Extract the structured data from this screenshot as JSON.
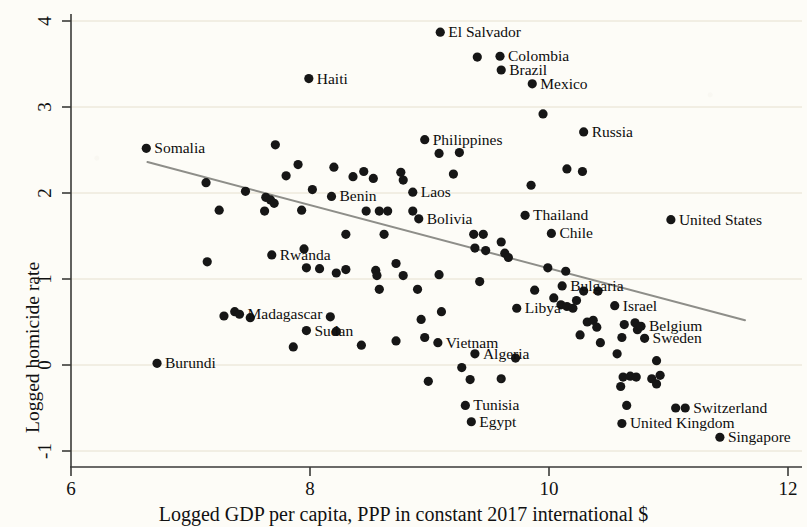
{
  "chart_data": {
    "type": "scatter",
    "title": "",
    "xlabel": "Logged GDP per capita, PPP in constant 2017 international $",
    "ylabel": "Logged homicide rate",
    "xlim": [
      6,
      12
    ],
    "ylim": [
      -1,
      4
    ],
    "xticks": [
      6,
      8,
      10,
      12
    ],
    "yticks": [
      -1,
      0,
      1,
      2,
      3,
      4
    ],
    "grid": true,
    "grid_axis": "y",
    "legend": "none",
    "marker": "filled-circle",
    "marker_color": "#161616",
    "fit_line": {
      "label": "linear fit",
      "color": "#8a8a86",
      "x_start": 6.64,
      "y_start": 2.36,
      "x_end": 11.64,
      "y_end": 0.52
    },
    "labeled_points": [
      {
        "name": "El Salvador",
        "x": 9.09,
        "y": 3.87,
        "label_side": "right"
      },
      {
        "name": "Colombia",
        "x": 9.59,
        "y": 3.59,
        "label_side": "right"
      },
      {
        "name": "Brazil",
        "x": 9.6,
        "y": 3.43,
        "label_side": "right"
      },
      {
        "name": "Mexico",
        "x": 9.86,
        "y": 3.27,
        "label_side": "right"
      },
      {
        "name": "Haiti",
        "x": 7.99,
        "y": 3.33,
        "label_side": "right"
      },
      {
        "name": "Somalia",
        "x": 6.63,
        "y": 2.52,
        "label_side": "right"
      },
      {
        "name": "Philippines",
        "x": 8.96,
        "y": 2.62,
        "label_side": "right"
      },
      {
        "name": "Russia",
        "x": 10.29,
        "y": 2.71,
        "label_side": "right"
      },
      {
        "name": "Laos",
        "x": 8.86,
        "y": 2.01,
        "label_side": "right"
      },
      {
        "name": "Benin",
        "x": 8.18,
        "y": 1.96,
        "label_side": "right"
      },
      {
        "name": "Thailand",
        "x": 9.8,
        "y": 1.74,
        "label_side": "right"
      },
      {
        "name": "Bolivia",
        "x": 8.91,
        "y": 1.7,
        "label_side": "right"
      },
      {
        "name": "United States",
        "x": 11.02,
        "y": 1.69,
        "label_side": "right"
      },
      {
        "name": "Chile",
        "x": 10.02,
        "y": 1.53,
        "label_side": "right"
      },
      {
        "name": "Rwanda",
        "x": 7.68,
        "y": 1.28,
        "label_side": "right"
      },
      {
        "name": "Bulgaria",
        "x": 10.11,
        "y": 0.92,
        "label_side": "right"
      },
      {
        "name": "Israel",
        "x": 10.55,
        "y": 0.69,
        "label_side": "right"
      },
      {
        "name": "Libya",
        "x": 9.73,
        "y": 0.66,
        "label_side": "right"
      },
      {
        "name": "Madagascar",
        "x": 7.41,
        "y": 0.59,
        "label_side": "right"
      },
      {
        "name": "Belgium",
        "x": 10.77,
        "y": 0.45,
        "label_side": "right"
      },
      {
        "name": "Sweden",
        "x": 10.8,
        "y": 0.31,
        "label_side": "right"
      },
      {
        "name": "Sudan",
        "x": 7.97,
        "y": 0.4,
        "label_side": "right"
      },
      {
        "name": "Vietnam",
        "x": 9.07,
        "y": 0.26,
        "label_side": "right"
      },
      {
        "name": "Algeria",
        "x": 9.38,
        "y": 0.13,
        "label_side": "right"
      },
      {
        "name": "Burundi",
        "x": 6.72,
        "y": 0.02,
        "label_side": "right"
      },
      {
        "name": "Tunisia",
        "x": 9.3,
        "y": -0.47,
        "label_side": "right"
      },
      {
        "name": "Switzerland",
        "x": 11.14,
        "y": -0.5,
        "label_side": "right"
      },
      {
        "name": "Egypt",
        "x": 9.35,
        "y": -0.66,
        "label_side": "right"
      },
      {
        "name": "United Kingdom",
        "x": 10.61,
        "y": -0.68,
        "label_side": "right"
      },
      {
        "name": "Singapore",
        "x": 11.43,
        "y": -0.84,
        "label_side": "right"
      }
    ],
    "unlabeled_points": [
      {
        "x": 9.4,
        "y": 3.58
      },
      {
        "x": 9.95,
        "y": 2.92
      },
      {
        "x": 9.08,
        "y": 2.46
      },
      {
        "x": 9.25,
        "y": 2.47
      },
      {
        "x": 10.15,
        "y": 2.28
      },
      {
        "x": 10.28,
        "y": 2.25
      },
      {
        "x": 9.2,
        "y": 2.22
      },
      {
        "x": 9.85,
        "y": 2.09
      },
      {
        "x": 7.71,
        "y": 2.56
      },
      {
        "x": 7.9,
        "y": 2.33
      },
      {
        "x": 7.8,
        "y": 2.2
      },
      {
        "x": 8.2,
        "y": 2.3
      },
      {
        "x": 8.45,
        "y": 2.25
      },
      {
        "x": 8.53,
        "y": 2.17
      },
      {
        "x": 8.76,
        "y": 2.24
      },
      {
        "x": 8.78,
        "y": 2.15
      },
      {
        "x": 8.36,
        "y": 2.19
      },
      {
        "x": 7.13,
        "y": 2.12
      },
      {
        "x": 7.46,
        "y": 2.02
      },
      {
        "x": 7.24,
        "y": 1.8
      },
      {
        "x": 7.63,
        "y": 1.95
      },
      {
        "x": 7.67,
        "y": 1.92
      },
      {
        "x": 7.7,
        "y": 1.88
      },
      {
        "x": 7.62,
        "y": 1.79
      },
      {
        "x": 7.93,
        "y": 1.8
      },
      {
        "x": 8.02,
        "y": 2.04
      },
      {
        "x": 8.47,
        "y": 1.79
      },
      {
        "x": 8.58,
        "y": 1.79
      },
      {
        "x": 8.65,
        "y": 1.79
      },
      {
        "x": 8.86,
        "y": 1.79
      },
      {
        "x": 8.3,
        "y": 1.52
      },
      {
        "x": 8.62,
        "y": 1.52
      },
      {
        "x": 9.37,
        "y": 1.52
      },
      {
        "x": 9.45,
        "y": 1.52
      },
      {
        "x": 9.38,
        "y": 1.36
      },
      {
        "x": 9.47,
        "y": 1.33
      },
      {
        "x": 9.6,
        "y": 1.43
      },
      {
        "x": 9.63,
        "y": 1.3
      },
      {
        "x": 9.66,
        "y": 1.25
      },
      {
        "x": 7.14,
        "y": 1.2
      },
      {
        "x": 7.95,
        "y": 1.35
      },
      {
        "x": 7.97,
        "y": 1.13
      },
      {
        "x": 8.08,
        "y": 1.12
      },
      {
        "x": 8.22,
        "y": 1.07
      },
      {
        "x": 8.3,
        "y": 1.11
      },
      {
        "x": 8.55,
        "y": 1.1
      },
      {
        "x": 8.56,
        "y": 1.04
      },
      {
        "x": 8.72,
        "y": 1.18
      },
      {
        "x": 8.78,
        "y": 1.04
      },
      {
        "x": 9.08,
        "y": 1.05
      },
      {
        "x": 9.42,
        "y": 0.97
      },
      {
        "x": 9.99,
        "y": 1.13
      },
      {
        "x": 10.14,
        "y": 1.09
      },
      {
        "x": 9.88,
        "y": 0.87
      },
      {
        "x": 10.29,
        "y": 0.86
      },
      {
        "x": 10.41,
        "y": 0.86
      },
      {
        "x": 10.04,
        "y": 0.78
      },
      {
        "x": 10.1,
        "y": 0.7
      },
      {
        "x": 10.15,
        "y": 0.68
      },
      {
        "x": 10.2,
        "y": 0.66
      },
      {
        "x": 10.23,
        "y": 0.75
      },
      {
        "x": 7.37,
        "y": 0.62
      },
      {
        "x": 7.28,
        "y": 0.57
      },
      {
        "x": 7.5,
        "y": 0.55
      },
      {
        "x": 8.17,
        "y": 0.56
      },
      {
        "x": 8.22,
        "y": 0.39
      },
      {
        "x": 7.86,
        "y": 0.21
      },
      {
        "x": 8.43,
        "y": 0.23
      },
      {
        "x": 8.58,
        "y": 0.88
      },
      {
        "x": 8.9,
        "y": 0.88
      },
      {
        "x": 8.93,
        "y": 0.53
      },
      {
        "x": 9.1,
        "y": 0.62
      },
      {
        "x": 8.72,
        "y": 0.28
      },
      {
        "x": 8.96,
        "y": 0.32
      },
      {
        "x": 10.32,
        "y": 0.5
      },
      {
        "x": 10.37,
        "y": 0.52
      },
      {
        "x": 10.4,
        "y": 0.44
      },
      {
        "x": 10.26,
        "y": 0.35
      },
      {
        "x": 10.63,
        "y": 0.47
      },
      {
        "x": 10.72,
        "y": 0.49
      },
      {
        "x": 10.74,
        "y": 0.41
      },
      {
        "x": 10.61,
        "y": 0.32
      },
      {
        "x": 10.43,
        "y": 0.26
      },
      {
        "x": 10.57,
        "y": 0.13
      },
      {
        "x": 9.72,
        "y": 0.08
      },
      {
        "x": 9.27,
        "y": -0.03
      },
      {
        "x": 8.99,
        "y": -0.19
      },
      {
        "x": 9.34,
        "y": -0.17
      },
      {
        "x": 9.6,
        "y": -0.16
      },
      {
        "x": 10.9,
        "y": 0.05
      },
      {
        "x": 10.62,
        "y": -0.14
      },
      {
        "x": 10.68,
        "y": -0.13
      },
      {
        "x": 10.73,
        "y": -0.14
      },
      {
        "x": 10.6,
        "y": -0.25
      },
      {
        "x": 10.86,
        "y": -0.16
      },
      {
        "x": 10.9,
        "y": -0.22
      },
      {
        "x": 10.93,
        "y": -0.12
      },
      {
        "x": 11.06,
        "y": -0.5
      },
      {
        "x": 10.65,
        "y": -0.47
      }
    ]
  },
  "axes": {
    "x_tick_labels": [
      "6",
      "8",
      "10",
      "12"
    ],
    "y_tick_labels": [
      "4",
      "3",
      "2",
      "1",
      "0",
      "-1"
    ],
    "x_title": "Logged GDP per capita, PPP in constant 2017 international $",
    "y_title": "Logged homicide rate"
  },
  "style": {
    "background": "#fdfcf7",
    "axis_color": "#3a3a38",
    "grid_color": "#e6e0cf",
    "point_color": "#161616",
    "fit_line_color": "#8e8e89"
  }
}
